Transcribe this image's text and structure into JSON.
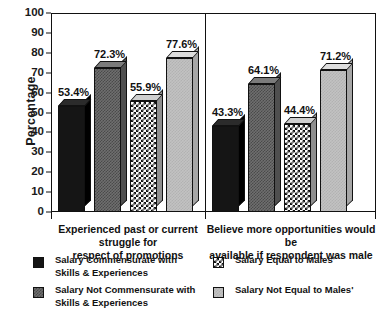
{
  "chart_data": {
    "type": "bar",
    "title": "",
    "xlabel": "",
    "ylabel": "Percentage",
    "ylim": [
      0,
      100
    ],
    "ytick_step": 10,
    "yticks": [
      100,
      90,
      80,
      70,
      60,
      50,
      40,
      30,
      20,
      10,
      0
    ],
    "grid": false,
    "legend_position": "bottom",
    "categories": [
      "Experienced past or current struggle for\nrespect of promotions",
      "Believe more opportunities would be\navailable if respondent was male"
    ],
    "series": [
      {
        "name": "Salary Commensurate with\nSkills & Experiences",
        "values": [
          53.4,
          43.3
        ],
        "labels": [
          "53.4%",
          "43.3%"
        ],
        "pattern": "solid-black",
        "color": "#151515"
      },
      {
        "name": "Salary Not Commensurate with\nSkills & Experiences",
        "values": [
          72.3,
          64.1
        ],
        "labels": [
          "72.3%",
          "64.1%"
        ],
        "pattern": "fine-dark-checker",
        "color": "#6f6f6f"
      },
      {
        "name": "Salary Equal to Males'",
        "values": [
          55.9,
          44.4
        ],
        "labels": [
          "55.9%",
          "44.4%"
        ],
        "pattern": "bold-checkerboard",
        "color": "#ffffff"
      },
      {
        "name": "Salary Not Equal to Males'",
        "values": [
          77.6,
          71.2
        ],
        "labels": [
          "77.6%",
          "71.2%"
        ],
        "pattern": "light-gray",
        "color": "#c2c2c2"
      }
    ]
  },
  "legend": {
    "items": [
      {
        "label": "Salary Commensurate with\nSkills & Experiences"
      },
      {
        "label": "Salary Not Commensurate with\nSkills & Experiences"
      },
      {
        "label": "Salary Equal to Males'"
      },
      {
        "label": "Salary Not Equal to Males'"
      }
    ]
  }
}
